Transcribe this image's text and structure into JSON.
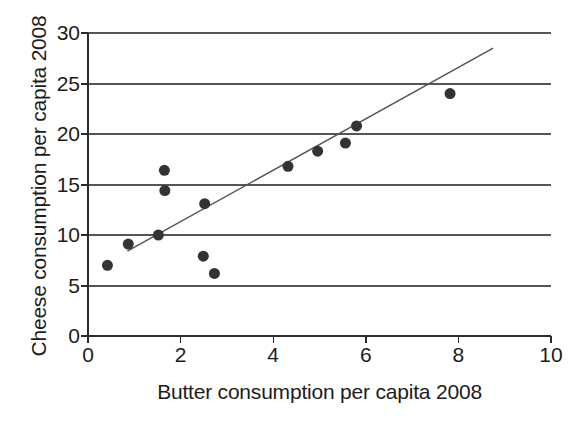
{
  "chart_data": {
    "type": "scatter",
    "title": "",
    "xlabel": "Butter consumption per capita 2008",
    "ylabel": "Cheese consumption per capita 2008",
    "xlim": [
      0,
      10
    ],
    "ylim": [
      0,
      30
    ],
    "xticks": [
      0,
      2,
      4,
      6,
      8,
      10
    ],
    "yticks": [
      0,
      5,
      10,
      15,
      20,
      25,
      30
    ],
    "xtick_labels": [
      "0",
      "2",
      "4",
      "6",
      "8",
      "10"
    ],
    "ytick_labels": [
      "0",
      "5",
      "10",
      "15",
      "20",
      "25",
      "30"
    ],
    "grid": "horizontal",
    "legend": "none",
    "marker_color": "#333333",
    "marker_shape": "circle",
    "marker_size_px": 11,
    "line_color": "#555555",
    "points": [
      {
        "x": 0.42,
        "y": 7.0
      },
      {
        "x": 0.87,
        "y": 9.1
      },
      {
        "x": 1.52,
        "y": 10.0
      },
      {
        "x": 1.65,
        "y": 16.4
      },
      {
        "x": 1.66,
        "y": 14.4
      },
      {
        "x": 2.49,
        "y": 7.9
      },
      {
        "x": 2.52,
        "y": 13.1
      },
      {
        "x": 2.73,
        "y": 6.2
      },
      {
        "x": 4.32,
        "y": 16.8
      },
      {
        "x": 4.96,
        "y": 18.3
      },
      {
        "x": 5.56,
        "y": 19.1
      },
      {
        "x": 5.8,
        "y": 20.8
      },
      {
        "x": 7.82,
        "y": 24.0
      }
    ],
    "trendline": {
      "type": "linear-fit",
      "x_start": 0.85,
      "y_start": 8.4,
      "x_end": 8.75,
      "y_end": 28.5
    }
  }
}
